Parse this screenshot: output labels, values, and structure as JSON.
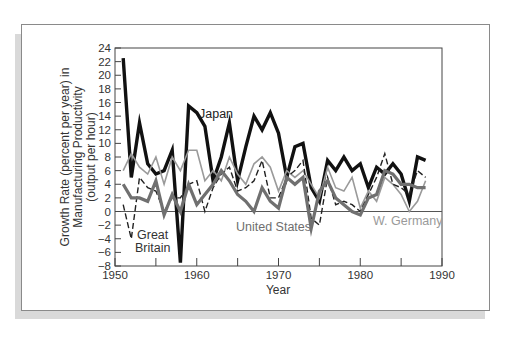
{
  "chart_data": {
    "type": "line",
    "title": "",
    "xlabel": "Year",
    "ylabel": "Growth Rate (percent per year) in Manufacturing Productivity (output per hour)",
    "ylabel_lines": [
      "Growth Rate (percent per year) in",
      "Manufacturing Productivity",
      "(output per hour)"
    ],
    "xlim": [
      1950,
      1990
    ],
    "ylim": [
      -8,
      24
    ],
    "x_ticks": [
      1950,
      1960,
      1970,
      1980,
      1990
    ],
    "x_minor_ticks": [
      1955,
      1965,
      1975,
      1985
    ],
    "y_ticks": [
      24,
      22,
      20,
      18,
      16,
      14,
      12,
      10,
      8,
      6,
      4,
      2,
      0,
      -2,
      -4,
      -6,
      -8
    ],
    "y_tick_labels": [
      "24",
      "22",
      "20",
      "18",
      "16",
      "14",
      "12",
      "10",
      "8",
      "6",
      "4",
      "2",
      "0",
      "−2",
      "−4",
      "−6",
      "−8"
    ],
    "grid": false,
    "zero_line": true,
    "legend": "inline labels",
    "x": [
      1951,
      1952,
      1953,
      1954,
      1955,
      1956,
      1957,
      1958,
      1959,
      1960,
      1961,
      1962,
      1963,
      1964,
      1965,
      1966,
      1967,
      1968,
      1969,
      1970,
      1971,
      1972,
      1973,
      1974,
      1975,
      1976,
      1977,
      1978,
      1979,
      1980,
      1981,
      1982,
      1983,
      1984,
      1985,
      1986,
      1987,
      1988
    ],
    "series": [
      {
        "name": "Japan",
        "style": "thick-black",
        "color": "#111111",
        "values": [
          22.5,
          5,
          13,
          7,
          5.5,
          6,
          9,
          -7.5,
          15.5,
          14.5,
          12.5,
          4.5,
          8,
          13,
          4.5,
          9.5,
          14,
          12,
          14.5,
          11.5,
          5,
          9.5,
          10,
          3.5,
          1.5,
          7.5,
          6,
          8,
          6,
          7,
          3.5,
          6.5,
          5.5,
          7,
          5.5,
          1.5,
          8,
          7.5
        ]
      },
      {
        "name": "W. Germany",
        "style": "thin-gray",
        "color": "#8f8f8f",
        "values": [
          6,
          8.5,
          6.5,
          5.5,
          8,
          4,
          8,
          6,
          9,
          9,
          4.5,
          6,
          4.5,
          8,
          5.5,
          4,
          7,
          8,
          6.5,
          3,
          6,
          5,
          6,
          4,
          2,
          6.5,
          3.5,
          3,
          5,
          0.5,
          3,
          1.5,
          5,
          4,
          2.5,
          0,
          1.5,
          4.5
        ]
      },
      {
        "name": "Great Britain",
        "style": "dashed-black",
        "color": "#222222",
        "values": [
          1,
          -4,
          5,
          3.5,
          3,
          0,
          2,
          2,
          4,
          4.5,
          0,
          3.5,
          5.5,
          6.5,
          3,
          3.5,
          4.5,
          7.5,
          2,
          2,
          5,
          6,
          7.5,
          -1,
          -2,
          5,
          1,
          1.5,
          1,
          0,
          2.5,
          5,
          8.5,
          4,
          3.5,
          2.5,
          6,
          5
        ]
      },
      {
        "name": "United States",
        "style": "thick-gray",
        "color": "#6e6e6e",
        "values": [
          4,
          2,
          2,
          1.5,
          4.5,
          -0.5,
          2.5,
          0,
          4,
          1,
          2.5,
          4,
          6,
          4.5,
          2.5,
          1.5,
          0,
          3.5,
          1.5,
          0.5,
          5,
          4,
          5,
          -2.5,
          3,
          4.5,
          2,
          1,
          0,
          -0.5,
          2,
          2.5,
          6,
          5.5,
          4,
          4,
          3.5,
          3.5
        ]
      }
    ],
    "annotations": [
      {
        "text": "Japan",
        "near_year": 1961,
        "near_value": 14.5
      },
      {
        "text": "Great",
        "near_year": 1953,
        "near_value": -3.2
      },
      {
        "text": "Britain",
        "near_year": 1953,
        "near_value": -5.2
      },
      {
        "text": "United States",
        "near_year": 1967,
        "near_value": -2.3
      },
      {
        "text": "W. Germany",
        "near_year": 1984,
        "near_value": -1.3
      }
    ]
  },
  "labels": {
    "japan": "Japan",
    "great": "Great",
    "britain": "Britain",
    "united_states": "United States",
    "w_germany": "W. Germany",
    "xlabel": "Year",
    "ylabel_line1": "Growth Rate (percent per year) in",
    "ylabel_line2": "Manufacturing Productivity",
    "ylabel_line3": "(output per hour)"
  }
}
